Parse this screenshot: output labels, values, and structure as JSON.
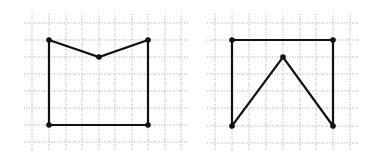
{
  "figure": {
    "colors": {
      "background": "#ffffff",
      "grid": "#9a9a9a",
      "stroke": "#111111"
    },
    "panels": [
      {
        "name": "left-figure",
        "grid": {
          "x": [
            32,
            49,
            66,
            82,
            99,
            115,
            132,
            148,
            165,
            181
          ],
          "y": [
            23,
            40,
            57,
            74,
            91,
            108,
            125,
            142
          ],
          "x_min": 24,
          "x_max": 188,
          "y_min": 14,
          "y_max": 150
        },
        "vertices": [
          [
            49,
            40
          ],
          [
            99,
            57
          ],
          [
            148,
            40
          ],
          [
            148,
            125
          ],
          [
            49,
            125
          ]
        ],
        "grid_vertices": [
          [
            1,
            1
          ],
          [
            4,
            2
          ],
          [
            7,
            1
          ],
          [
            7,
            6
          ],
          [
            1,
            6
          ]
        ]
      },
      {
        "name": "right-figure",
        "grid": {
          "x": [
            215,
            232,
            249,
            266,
            283,
            300,
            316,
            333,
            350
          ],
          "y": [
            23,
            40,
            57,
            74,
            91,
            108,
            126,
            143
          ],
          "x_min": 207,
          "x_max": 358,
          "y_min": 14,
          "y_max": 150
        },
        "vertices": [
          [
            232,
            40
          ],
          [
            333,
            40
          ],
          [
            333,
            126
          ],
          [
            283,
            57
          ],
          [
            232,
            126
          ]
        ],
        "grid_vertices": [
          [
            1,
            1
          ],
          [
            7,
            1
          ],
          [
            7,
            6
          ],
          [
            4,
            2
          ],
          [
            1,
            6
          ]
        ]
      }
    ]
  }
}
